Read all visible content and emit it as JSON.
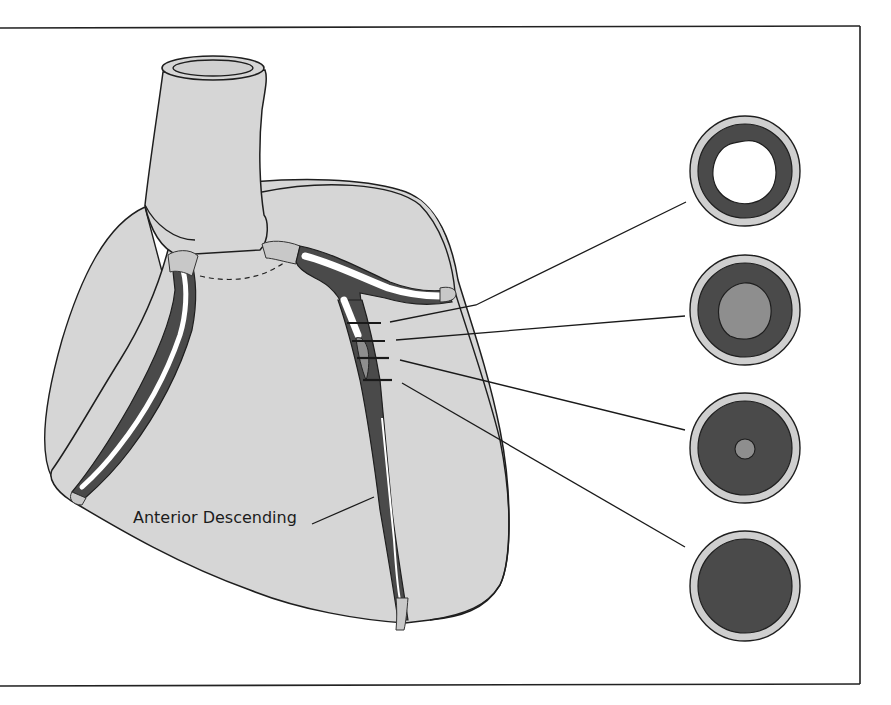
{
  "figure": {
    "labels": {
      "artery_label": "Anterior Descending"
    },
    "cross_sections": [
      {
        "id": 1,
        "state": "open lumen",
        "lumen": "white"
      },
      {
        "id": 2,
        "state": "partial plaque",
        "lumen": "gray plaque"
      },
      {
        "id": 3,
        "state": "severe narrowing",
        "lumen": "small gray"
      },
      {
        "id": 4,
        "state": "total occlusion",
        "lumen": "none"
      }
    ],
    "colors": {
      "heart_fill": "#d6d6d6",
      "outline": "#1e1e1e",
      "vessel_wall": "#4a4a4a",
      "plaque": "#8e8e8e",
      "ring": "#cfcfcf",
      "lumen": "#ffffff"
    }
  }
}
